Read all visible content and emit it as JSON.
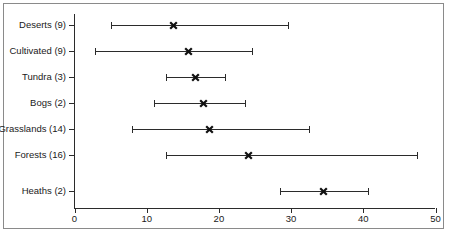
{
  "chart_data": {
    "type": "scatter",
    "title": "",
    "subtitle": "",
    "xlabel": "",
    "ylabel": "",
    "xlim": [
      0,
      50
    ],
    "grid": false,
    "legend": null,
    "orientation": "horizontal",
    "marker_style": "x",
    "series_description": "Mean with minimum-maximum range bars per habitat type",
    "xticks": [
      {
        "value": 0,
        "label": "0"
      },
      {
        "value": 10,
        "label": "10"
      },
      {
        "value": 20,
        "label": "20"
      },
      {
        "value": 30,
        "label": "30"
      },
      {
        "value": 40,
        "label": "40"
      },
      {
        "value": 50,
        "label": "50"
      }
    ],
    "categories": [
      "Deserts (9)",
      "Cultivated (9)",
      "Tundra (3)",
      "Bogs (2)",
      "Grasslands (14)",
      "Forests (16)",
      "Heaths (2)"
    ],
    "rows": [
      {
        "label": "Deserts (9)",
        "n": 9,
        "low": 5.0,
        "mean": 13.7,
        "high": 29.6
      },
      {
        "label": "Cultivated (9)",
        "n": 9,
        "low": 2.9,
        "mean": 15.8,
        "high": 24.6
      },
      {
        "label": "Tundra (3)",
        "n": 3,
        "low": 12.7,
        "mean": 16.8,
        "high": 20.8
      },
      {
        "label": "Bogs (2)",
        "n": 2,
        "low": 11.0,
        "mean": 17.9,
        "high": 23.6
      },
      {
        "label": "Grasslands (14)",
        "n": 14,
        "low": 7.9,
        "mean": 18.7,
        "high": 32.5
      },
      {
        "label": "Forests (16)",
        "n": 16,
        "low": 12.7,
        "mean": 24.1,
        "high": 47.5
      },
      {
        "label": "Heaths (2)",
        "n": 2,
        "low": 28.5,
        "mean": 34.5,
        "high": 40.6
      }
    ],
    "values": [
      13.7,
      15.8,
      16.8,
      17.9,
      18.7,
      24.1,
      34.5
    ],
    "colors": {
      "axis": "#2b2b2b",
      "marker": "#111111",
      "range": "#2b2b2b",
      "border": "#8a8a8a",
      "background": "#ffffff"
    }
  }
}
